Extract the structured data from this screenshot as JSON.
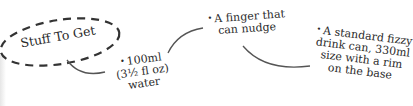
{
  "title": "Stuff To Get",
  "items": [
    {
      "bullet": "•",
      "lines": [
        "100ml",
        "(3½ fl oz)",
        "water"
      ]
    },
    {
      "bullet": "•",
      "lines": [
        "A finger that",
        "can nudge"
      ]
    },
    {
      "bullet": "•",
      "lines": [
        "A standard fizzy",
        "drink can, 330ml",
        "size with a rim",
        "on the base"
      ]
    }
  ],
  "colors": {
    "ink": "#2a2a2a",
    "line": "#555555"
  }
}
